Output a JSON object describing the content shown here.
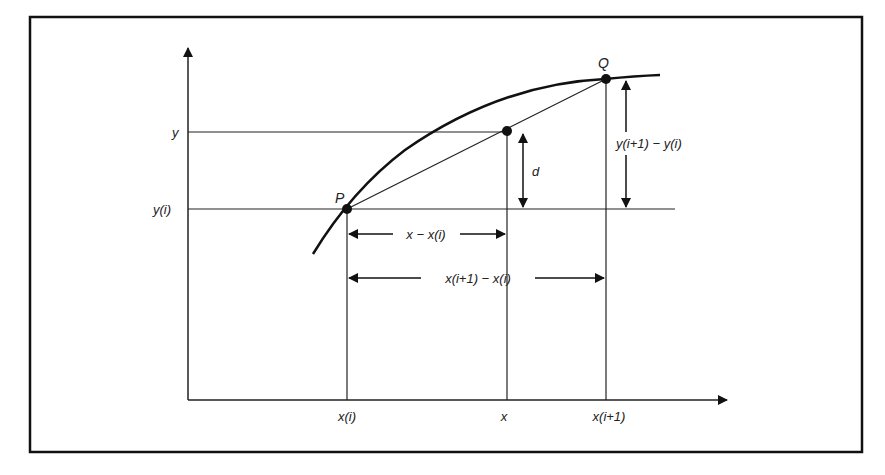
{
  "diagram": {
    "points": {
      "P": {
        "label": "P"
      },
      "Q": {
        "label": "Q"
      }
    },
    "y_axis_labels": {
      "y": "y",
      "y_i": "y(i)"
    },
    "x_axis_labels": {
      "x_i": "x(i)",
      "x": "x",
      "x_i1": "x(i+1)"
    },
    "dimensions": {
      "d": "d",
      "dx_partial": "x − x(i)",
      "dx_full": "x(i+1) − x(i)",
      "dy_full": "y(i+1) − y(i)"
    }
  }
}
